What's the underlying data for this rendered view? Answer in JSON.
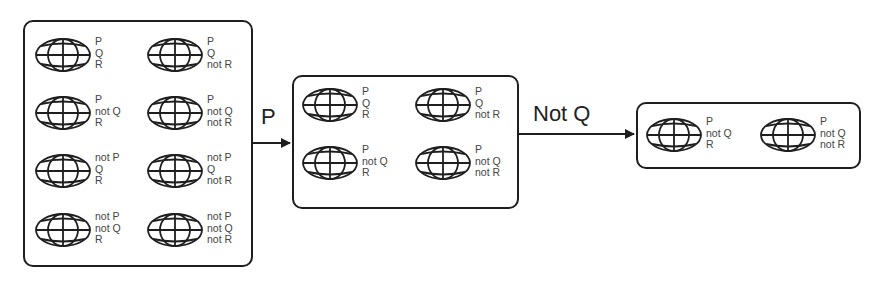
{
  "diagram": {
    "boxes": [
      {
        "name": "all-worlds",
        "worlds": [
          {
            "lines": [
              "P",
              "Q",
              "R"
            ]
          },
          {
            "lines": [
              "P",
              "Q",
              "not R"
            ]
          },
          {
            "lines": [
              "P",
              "not Q",
              "R"
            ]
          },
          {
            "lines": [
              "P",
              "not Q",
              "not R"
            ]
          },
          {
            "lines": [
              "not P",
              "Q",
              "R"
            ]
          },
          {
            "lines": [
              "not P",
              "Q",
              "not R"
            ]
          },
          {
            "lines": [
              "not P",
              "not Q",
              "R"
            ]
          },
          {
            "lines": [
              "not P",
              "not Q",
              "not R"
            ]
          }
        ]
      },
      {
        "name": "after-p",
        "worlds": [
          {
            "lines": [
              "P",
              "Q",
              "R"
            ]
          },
          {
            "lines": [
              "P",
              "Q",
              "not R"
            ]
          },
          {
            "lines": [
              "P",
              "not Q",
              "R"
            ]
          },
          {
            "lines": [
              "P",
              "not Q",
              "not R"
            ]
          }
        ]
      },
      {
        "name": "after-not-q",
        "worlds": [
          {
            "lines": [
              "P",
              "not Q",
              "R"
            ]
          },
          {
            "lines": [
              "P",
              "not Q",
              "not R"
            ]
          }
        ]
      }
    ],
    "arrows": [
      {
        "label": "P"
      },
      {
        "label": "Not Q"
      }
    ],
    "icon": "globe-icon",
    "colors": {
      "stroke": "#1e1e1e",
      "text": "#444444"
    }
  }
}
